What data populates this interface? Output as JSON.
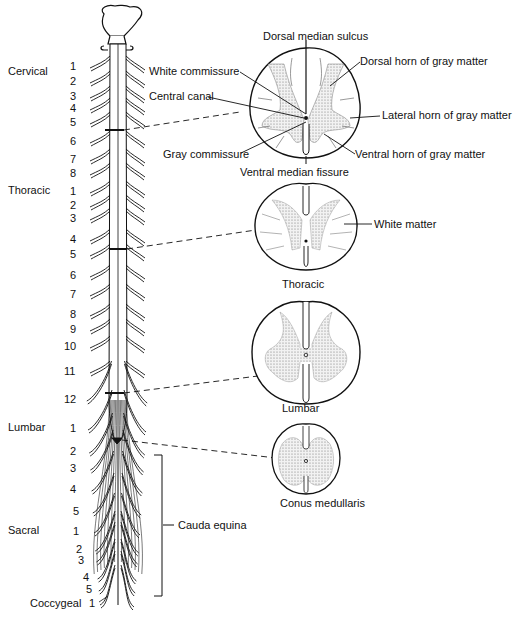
{
  "regions": [
    {
      "name": "Cervical",
      "y": 72
    },
    {
      "name": "Thoracic",
      "y": 191
    },
    {
      "name": "Lumbar",
      "y": 428
    },
    {
      "name": "Sacral",
      "y": 531
    },
    {
      "name": "Coccygeal",
      "y": 603
    }
  ],
  "nerve_numbers": [
    {
      "n": "1",
      "x": 70,
      "y": 66
    },
    {
      "n": "2",
      "x": 70,
      "y": 81
    },
    {
      "n": "3",
      "x": 70,
      "y": 96
    },
    {
      "n": "4",
      "x": 70,
      "y": 108
    },
    {
      "n": "5",
      "x": 70,
      "y": 122
    },
    {
      "n": "6",
      "x": 70,
      "y": 141
    },
    {
      "n": "7",
      "x": 70,
      "y": 159
    },
    {
      "n": "8",
      "x": 70,
      "y": 173
    },
    {
      "n": "1",
      "x": 70,
      "y": 191
    },
    {
      "n": "2",
      "x": 70,
      "y": 205
    },
    {
      "n": "3",
      "x": 70,
      "y": 218
    },
    {
      "n": "4",
      "x": 70,
      "y": 239
    },
    {
      "n": "5",
      "x": 70,
      "y": 254
    },
    {
      "n": "6",
      "x": 70,
      "y": 275
    },
    {
      "n": "7",
      "x": 70,
      "y": 294
    },
    {
      "n": "8",
      "x": 70,
      "y": 314
    },
    {
      "n": "9",
      "x": 70,
      "y": 329
    },
    {
      "n": "10",
      "x": 64,
      "y": 346
    },
    {
      "n": "11",
      "x": 64,
      "y": 371
    },
    {
      "n": "12",
      "x": 64,
      "y": 399
    },
    {
      "n": "1",
      "x": 70,
      "y": 428
    },
    {
      "n": "2",
      "x": 70,
      "y": 451
    },
    {
      "n": "3",
      "x": 70,
      "y": 468
    },
    {
      "n": "4",
      "x": 70,
      "y": 489
    },
    {
      "n": "5",
      "x": 73,
      "y": 511
    },
    {
      "n": "1",
      "x": 73,
      "y": 531
    },
    {
      "n": "2",
      "x": 76,
      "y": 549
    },
    {
      "n": "3",
      "x": 78,
      "y": 560
    },
    {
      "n": "4",
      "x": 83,
      "y": 577
    },
    {
      "n": "5",
      "x": 86,
      "y": 589
    },
    {
      "n": "1",
      "x": 89,
      "y": 603
    }
  ],
  "cross_sections": {
    "cervical": {
      "labels": {
        "dorsal_median_sulcus": "Dorsal median sulcus",
        "dorsal_horn": "Dorsal horn of gray matter",
        "white_commissure": "White commissure",
        "central_canal": "Central canal",
        "lateral_horn": "Lateral horn of gray matter",
        "gray_commissure": "Gray commissure",
        "ventral_horn": "Ventral horn of gray matter",
        "ventral_median_fissure": "Ventral median fissure"
      }
    },
    "thoracic": {
      "caption": "Thoracic",
      "white_matter": "White matter"
    },
    "lumbar": {
      "caption": "Lumbar"
    },
    "conus": {
      "caption": "Conus medullaris"
    }
  },
  "cauda_equina": "Cauda equina",
  "colors": {
    "ink": "#111111",
    "gray_matter": "#d9d9d9",
    "background": "#ffffff"
  }
}
